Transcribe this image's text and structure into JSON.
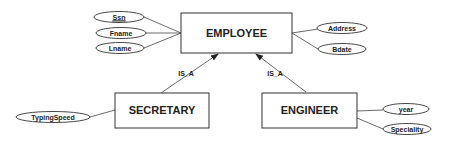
{
  "diagram": {
    "type": "ER specialization diagram",
    "entities": {
      "employee": {
        "label": "EMPLOYEE"
      },
      "secretary": {
        "label": "SECRETARY"
      },
      "engineer": {
        "label": "ENGINEER"
      }
    },
    "attributes": {
      "ssn": {
        "label": "Ssn",
        "key": true
      },
      "fname": {
        "label": "Fname"
      },
      "lname": {
        "label": "Lname"
      },
      "address": {
        "label": "Address"
      },
      "bdate": {
        "label": "Bdate"
      },
      "typing_speed": {
        "label": "TypingSpeed"
      },
      "year": {
        "label": "year"
      },
      "speciality": {
        "label": "Speciality"
      }
    },
    "relationships": {
      "secretary_isa": {
        "label": "IS_A",
        "from": "SECRETARY",
        "to": "EMPLOYEE"
      },
      "engineer_isa": {
        "label": "IS_A",
        "from": "ENGINEER",
        "to": "EMPLOYEE"
      }
    },
    "colors": {
      "stroke": "#333333",
      "background": "#ffffff"
    }
  }
}
